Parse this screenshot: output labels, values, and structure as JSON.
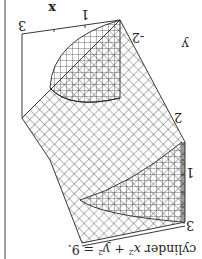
{
  "figure": {
    "orientation": "rotated-180",
    "caption": "cylinder x² + y² = 9.",
    "caption_parts": {
      "pre": "cylinder ",
      "x": "x",
      "sup1": "2",
      "plus": " + ",
      "y": "y",
      "sup2": "2",
      "eq": " = 9."
    },
    "axis_labels": {
      "x_axis": {
        "name": "x",
        "ticks": [
          "3",
          "1"
        ]
      },
      "y_axis": {
        "name": "y",
        "ticks": [
          "-2"
        ]
      },
      "z_axis": {
        "ticks": [
          "2",
          "1",
          "3"
        ]
      }
    },
    "colors": {
      "ink": "#222222",
      "paper": "#ffffff"
    }
  }
}
